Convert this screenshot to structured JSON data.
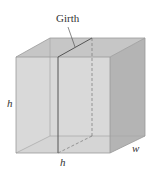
{
  "diagram": {
    "type": "box-girth",
    "labels": {
      "girth": "Girth",
      "height": "h",
      "bottom": "h",
      "width": "w"
    },
    "colors": {
      "front_face": "#d4d4d4",
      "top_face": "#c4c4c4",
      "right_face": "#b6b6b6",
      "bottom_face": "#e6e6e6",
      "edge": "#9a9a9a",
      "girth_line": "#555555"
    }
  }
}
